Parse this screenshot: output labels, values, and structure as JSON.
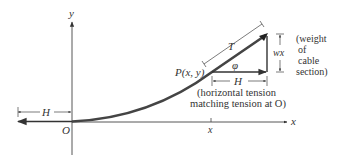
{
  "diagram": {
    "labels": {
      "y_axis": "y",
      "x_axis": "x",
      "origin": "O",
      "x_tick": "x",
      "h_left": "H",
      "h_right": "H",
      "point": "P(x, y)",
      "tension": "T",
      "angle": "φ",
      "weight": "wx",
      "weight_note": [
        "(weight",
        "of",
        "cable",
        "section)"
      ],
      "horizontal_note": [
        "(horizontal tension",
        "matching tension at O)"
      ]
    },
    "colors": {
      "ink": "#333333",
      "cable": "#444444",
      "background": "#ffffff"
    }
  }
}
